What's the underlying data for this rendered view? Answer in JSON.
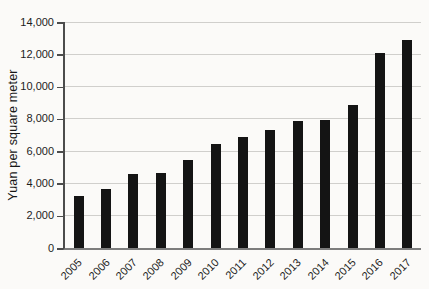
{
  "figure": {
    "background": "#fbfaf8",
    "bar_color": "#141414",
    "grid_color": "#d0cfcc",
    "axis_color": "#4c4c4c",
    "text_color": "#1d1d1d"
  },
  "chart_data": {
    "type": "bar",
    "title": "",
    "xlabel": "",
    "ylabel": "Yuan per square meter",
    "categories": [
      "2005",
      "2006",
      "2007",
      "2008",
      "2009",
      "2010",
      "2011",
      "2012",
      "2013",
      "2014",
      "2015",
      "2016",
      "2017"
    ],
    "values": [
      3200,
      3650,
      4600,
      4650,
      5450,
      6450,
      6850,
      7300,
      7850,
      7900,
      8850,
      12100,
      12900
    ],
    "ylim": [
      0,
      14000
    ],
    "ytick_step": 2000,
    "ytick_labels": [
      "0",
      "2,000",
      "4,000",
      "6,000",
      "8,000",
      "10,000",
      "12,000",
      "14,000"
    ],
    "grid": "horizontal",
    "legend": "none"
  }
}
